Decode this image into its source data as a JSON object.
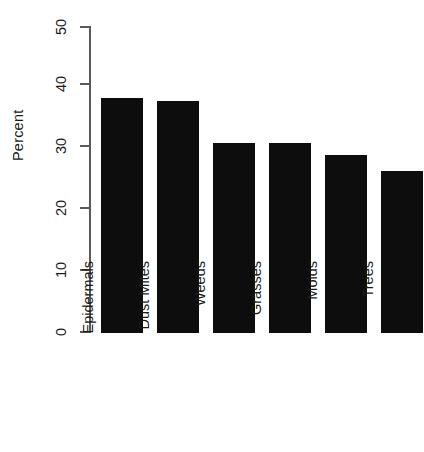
{
  "chart_data": {
    "type": "bar",
    "title": "",
    "xlabel": "",
    "ylabel": "Percent",
    "categories": [
      "Epidermals",
      "Dust Mites",
      "Weeds",
      "Grasses",
      "Molds",
      "Trees"
    ],
    "values": [
      38.2,
      37.8,
      31.0,
      31.0,
      29.0,
      26.4
    ],
    "ylim": [
      0,
      50
    ],
    "yticks": [
      0,
      10,
      20,
      30,
      40,
      50
    ],
    "ytick_labels": [
      "0",
      "10",
      "20",
      "30",
      "40",
      "50"
    ],
    "grid": false,
    "legend": false,
    "bar_color": "#0d0d0d",
    "axis_color": "#5a5a5a",
    "background_color": "#ffffff",
    "orientation": "vertical",
    "label_rotation": 90
  }
}
